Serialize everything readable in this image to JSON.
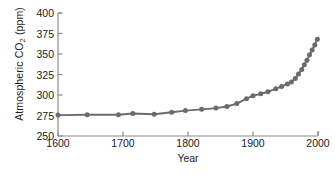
{
  "chart_data": {
    "type": "line",
    "title": "",
    "xlabel": "Year",
    "ylabel": "Atmospheric CO2 (ppm)",
    "ylabel_display": "Atmospheric CO",
    "ylabel_sub": "2",
    "ylabel_units": " (ppm)",
    "xlim": [
      1600,
      2000
    ],
    "ylim": [
      250,
      400
    ],
    "xticks": [
      1600,
      1700,
      1800,
      1900,
      2000
    ],
    "xtick_labels": [
      "1600",
      "1700",
      "1800",
      "1900",
      "2000"
    ],
    "yticks": [
      250,
      275,
      300,
      325,
      350,
      375,
      400
    ],
    "ytick_labels": [
      "250",
      "275",
      "300",
      "325",
      "350",
      "375",
      "400"
    ],
    "grid": false,
    "legend": null,
    "series_color": "#6b6b6b",
    "marker": "circle",
    "x": [
      1600,
      1645,
      1693,
      1715,
      1748,
      1775,
      1796,
      1821,
      1843,
      1860,
      1875,
      1890,
      1900,
      1912,
      1923,
      1935,
      1944,
      1953,
      1959,
      1965,
      1970,
      1975,
      1979,
      1983,
      1987,
      1991,
      1995,
      1999
    ],
    "values": [
      275.5,
      276.0,
      276.0,
      277.5,
      276.5,
      279.0,
      281.0,
      282.5,
      284.0,
      286.0,
      289.5,
      295.5,
      299.0,
      301.5,
      304.0,
      307.5,
      310.5,
      313.5,
      316.0,
      320.0,
      325.5,
      331.0,
      337.0,
      342.5,
      349.0,
      355.0,
      361.0,
      368.0
    ]
  },
  "axis": {
    "frame_color": "#8a8a8a",
    "text_color": "#1a1a1a"
  }
}
